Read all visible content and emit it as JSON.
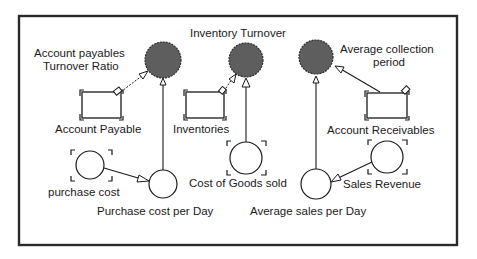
{
  "diagram": {
    "type": "stock-and-flow causal diagram",
    "colors": {
      "frame": "#2a2a2a",
      "output_node_fill": "#5e5e5e",
      "input_node_fill": "#ffffff",
      "text": "#1a1a1a"
    },
    "outputs": {
      "ap_turnover": {
        "line1": "Account payables",
        "line2": "Turnover Ratio"
      },
      "inventory_turnover": {
        "label": "Inventory Turnover"
      },
      "collection_period": {
        "line1": "Average collection",
        "line2": "period"
      }
    },
    "stocks": {
      "account_payable": {
        "label": "Account Payable"
      },
      "inventories": {
        "label": "Inventories"
      },
      "account_receivables": {
        "label": "Account Receivables"
      }
    },
    "converters": {
      "purchase_cost": {
        "label": "purchase cost"
      },
      "purchase_cost_per_day": {
        "label": "Purchase cost per Day"
      },
      "cost_of_goods_sold": {
        "label": "Cost of Goods sold"
      },
      "average_sales_per_day": {
        "label": "Average sales per Day"
      },
      "sales_revenue": {
        "label": "Sales Revenue"
      }
    },
    "links": [
      {
        "from": "Account Payable",
        "to": "Account payables Turnover Ratio"
      },
      {
        "from": "Purchase cost per Day",
        "to": "Account payables Turnover Ratio"
      },
      {
        "from": "purchase cost",
        "to": "Purchase cost per Day"
      },
      {
        "from": "Inventories",
        "to": "Inventory Turnover"
      },
      {
        "from": "Cost of Goods sold",
        "to": "Inventory Turnover"
      },
      {
        "from": "Average sales per Day",
        "to": "Average collection period"
      },
      {
        "from": "Account Receivables",
        "to": "Average collection period"
      },
      {
        "from": "Sales Revenue",
        "to": "Average sales per Day"
      }
    ]
  }
}
